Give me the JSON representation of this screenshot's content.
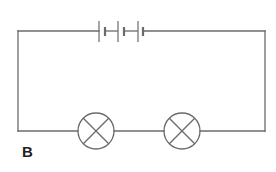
{
  "diagram": {
    "type": "circuit",
    "label": "B",
    "colors": {
      "wire": "#6b6b6b",
      "label": "#222222",
      "background": "#ffffff"
    },
    "components": {
      "battery": {
        "name": "battery",
        "cells": 3,
        "position": "top"
      },
      "lamps": [
        {
          "name": "lamp-1",
          "symbol": "circle-cross",
          "position": "bottom-left"
        },
        {
          "name": "lamp-2",
          "symbol": "circle-cross",
          "position": "bottom-right"
        }
      ]
    },
    "connection": "series"
  }
}
